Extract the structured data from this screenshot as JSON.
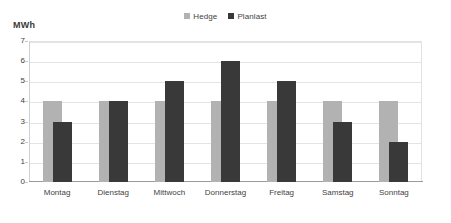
{
  "chart_data": {
    "type": "bar",
    "title": "",
    "subtitle": "",
    "xlabel": "",
    "ylabel": "MWh",
    "ylim": [
      0,
      7
    ],
    "ytick_step": 1,
    "yticks": [
      "7",
      "6",
      "5",
      "4",
      "3",
      "2",
      "1",
      "0"
    ],
    "grid": true,
    "grid_axis": "y",
    "legend_position": "top-center",
    "bar_overlap": true,
    "categories": [
      "Montag",
      "Dienstag",
      "Mittwoch",
      "Donnerstag",
      "Freitag",
      "Samstag",
      "Sonntag"
    ],
    "series": [
      {
        "name": "Hedge",
        "color": "#b2b2b2",
        "values": [
          4,
          4,
          4,
          4,
          4,
          4,
          4
        ]
      },
      {
        "name": "Planlast",
        "color": "#393939",
        "values": [
          3,
          4,
          5,
          6,
          5,
          3,
          2
        ]
      }
    ]
  },
  "legend": {
    "entries": [
      {
        "label": "Hedge",
        "color": "#b2b2b2"
      },
      {
        "label": "Planlast",
        "color": "#393939"
      }
    ]
  },
  "axes": {
    "unit_label": "MWh"
  },
  "colors": {
    "hedge": "#b2b2b2",
    "planlast": "#393939",
    "gridline": "#e4e4e4",
    "axis": "#9a9a9a",
    "background": "#ffffff",
    "text": "#3f3f3f"
  }
}
